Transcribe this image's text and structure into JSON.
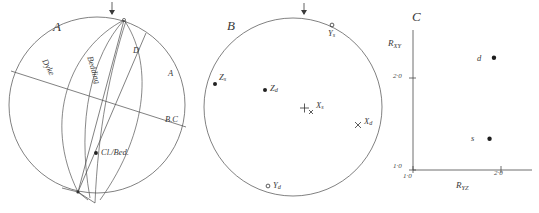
{
  "figure": {
    "panels": [
      {
        "id": "A",
        "letter": "A",
        "type": "stereonet",
        "description": "Equal-area stereographic projection showing great circles for bedding and a dyke with intersection lineations",
        "north_marker": "down-arrow",
        "labels": [
          {
            "name": "dyke-great-circle-label",
            "text": "Dyke"
          },
          {
            "name": "bedding-great-circle-label",
            "text": "Bedding"
          },
          {
            "name": "d-axis-label",
            "text": "D"
          },
          {
            "name": "a-axis-label",
            "text": "A"
          },
          {
            "name": "bc-intersection-label",
            "text": "B.C"
          },
          {
            "name": "cleavage-bedding-intersection",
            "text": "Cl./Bed."
          }
        ]
      },
      {
        "id": "B",
        "letter": "B",
        "type": "stereonet",
        "description": "Equal-area projection of principal strain axes for deformed and sedimentary fabrics",
        "north_marker": "down-arrow",
        "points": [
          {
            "name": "point-ys",
            "label": "Y",
            "sub": "s",
            "marker": "open-circle",
            "cx": 0.595,
            "cy": 0.075
          },
          {
            "name": "point-zs",
            "label": "Z",
            "sub": "s",
            "marker": "filled-dot",
            "cx": 0.035,
            "cy": 0.4
          },
          {
            "name": "point-zd",
            "label": "Z",
            "sub": "d",
            "marker": "filled-dot",
            "cx": 0.215,
            "cy": 0.52
          },
          {
            "name": "point-xs",
            "label": "X",
            "sub": "s",
            "marker": "plus-cross",
            "cx": 0.5,
            "cy": 0.61
          },
          {
            "name": "point-xd",
            "label": "X",
            "sub": "d",
            "marker": "cross",
            "cx": 0.905,
            "cy": 0.64
          },
          {
            "name": "point-yd",
            "label": "Y",
            "sub": "d",
            "marker": "open-circle",
            "cx": 0.33,
            "cy": 0.93
          }
        ]
      },
      {
        "id": "C",
        "letter": "C",
        "type": "scatter",
        "description": "Flinn deformation plot of strain ratios"
      }
    ]
  },
  "chart_data": {
    "type": "scatter",
    "title": "C",
    "xlabel": "R_YZ",
    "ylabel": "R_XY",
    "xlabel_main": "R",
    "xlabel_sub": "YZ",
    "ylabel_main": "R",
    "ylabel_sub": "XY",
    "xlim": [
      1.0,
      2.25
    ],
    "ylim": [
      1.0,
      2.45
    ],
    "xticks": [
      1.0,
      2.0
    ],
    "yticks": [
      1.0,
      2.0
    ],
    "xtick_labels": [
      "1·0",
      "2·0"
    ],
    "ytick_labels": [
      "1·0",
      "2·0"
    ],
    "grid": false,
    "legend": false,
    "points": [
      {
        "name": "point-d",
        "label": "d",
        "x": 1.92,
        "y": 2.22,
        "marker": "filled-dot"
      },
      {
        "name": "point-s",
        "label": "s",
        "x": 1.87,
        "y": 1.34,
        "marker": "filled-dot"
      }
    ]
  }
}
